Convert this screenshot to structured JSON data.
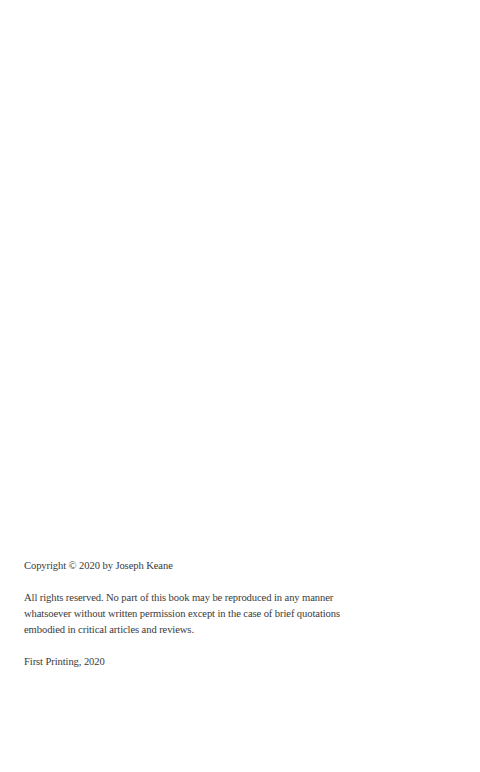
{
  "page": {
    "copyright_line": "Copyright © 2020 by Joseph Keane",
    "rights_lines": [
      "All rights reserved. No part of this book may be reproduced in any manner",
      "whatsoever without written permission except in the case of brief quotations",
      "embodied in critical articles and reviews."
    ],
    "printing_line": "First Printing, 2020"
  }
}
